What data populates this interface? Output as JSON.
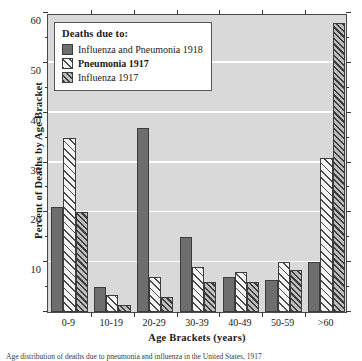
{
  "chart_data": {
    "type": "bar",
    "title": "",
    "xlabel": "Age Brackets (years)",
    "ylabel": "Percent of Deaths by Age Bracket",
    "categories": [
      "0-9",
      "10-19",
      "20-29",
      "30-39",
      "40-49",
      "50-59",
      ">60"
    ],
    "series": [
      {
        "name": "Influenza and Pneumonia 1918",
        "values": [
          21,
          5,
          37,
          15,
          7,
          6.5,
          10
        ]
      },
      {
        "name": "Pneumonia 1917",
        "values": [
          35,
          3.5,
          7,
          9,
          8,
          10,
          31
        ]
      },
      {
        "name": "Influenza 1917",
        "values": [
          20,
          1.5,
          3,
          6,
          6,
          8.5,
          58
        ]
      }
    ],
    "ylim": [
      0,
      60
    ],
    "yticks_major": [
      0,
      10,
      20,
      30,
      40,
      50,
      60
    ],
    "yticks_minor": [
      5,
      15,
      25,
      35,
      45,
      55
    ],
    "ytick_labels": [
      "0",
      "10",
      "20",
      "30",
      "40",
      "50",
      "60"
    ],
    "grid": true,
    "grid_color": "#ffffff",
    "plot_background": "#d9d9d9",
    "legend_position": "top-left"
  },
  "legend": {
    "title": "Deaths due to:",
    "entries": [
      {
        "label": "Influenza and Pneumonia 1918",
        "pattern": "solid",
        "color": "#6e6e6e",
        "bold": false
      },
      {
        "label": "Pneumonia 1917",
        "pattern": "diagonal-hatch-light",
        "color": "#f4f4f4",
        "bold": true
      },
      {
        "label": "Influenza 1917",
        "pattern": "diagonal-hatch-dense",
        "color": "#bdbdbd",
        "bold": false
      }
    ]
  },
  "caption": {
    "text": "Age distribution of deaths due to pneumonia and influenza in the United States, 1917"
  }
}
